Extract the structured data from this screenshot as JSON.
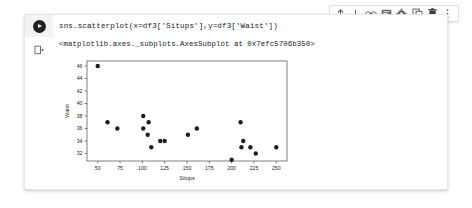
{
  "toolbar": {
    "icons": [
      {
        "name": "move-cell-up-icon",
        "label": "Move cell up"
      },
      {
        "name": "move-cell-down-icon",
        "label": "Move cell down"
      },
      {
        "name": "link-to-cell-icon",
        "label": "Link to cell"
      },
      {
        "name": "add-comment-icon",
        "label": "Add comment"
      },
      {
        "name": "cell-settings-gear-icon",
        "label": "Editor settings"
      },
      {
        "name": "copy-cell-icon",
        "label": "Copy cell"
      },
      {
        "name": "delete-cell-icon",
        "label": "Delete cell"
      },
      {
        "name": "more-options-icon",
        "label": "More cell actions"
      }
    ]
  },
  "cell": {
    "run_button_label": "Run cell",
    "code": "sns.scatterplot(x=df3['Situps'],y=df3['Waist'])",
    "output_prompt_icon": "output-cell-icon",
    "output_text": "<matplotlib.axes._subplots.AxesSubplot at 0x7efc5706b350>"
  },
  "chart_data": {
    "type": "scatter",
    "title": "",
    "xlabel": "Situps",
    "ylabel": "Waist",
    "xlim": [
      38,
      262
    ],
    "ylim": [
      30.8,
      46.8
    ],
    "xticks": [
      50,
      75,
      100,
      125,
      150,
      175,
      200,
      225,
      250
    ],
    "yticks": [
      32,
      34,
      36,
      38,
      40,
      42,
      44,
      46
    ],
    "grid": false,
    "legend": null,
    "marker_color": "#1f1f1f",
    "marker_size": 2.2,
    "series": [
      {
        "name": "Waist vs Situps",
        "points": [
          [
            50,
            46
          ],
          [
            61,
            37
          ],
          [
            72,
            36
          ],
          [
            101,
            38
          ],
          [
            101,
            36
          ],
          [
            107,
            37
          ],
          [
            106,
            35
          ],
          [
            110,
            33
          ],
          [
            120,
            34
          ],
          [
            125,
            34
          ],
          [
            151,
            35
          ],
          [
            161,
            36
          ],
          [
            200,
            31
          ],
          [
            210,
            37
          ],
          [
            213,
            34
          ],
          [
            211,
            33
          ],
          [
            221,
            33
          ],
          [
            227,
            32
          ],
          [
            250,
            33
          ]
        ]
      }
    ]
  }
}
